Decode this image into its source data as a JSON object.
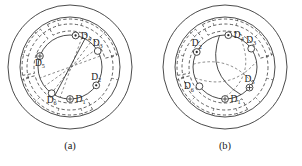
{
  "figure": {
    "background_color": "#ffffff",
    "line_color": "#2b2b2b",
    "panels": [
      {
        "id": "panel-a",
        "caption": "(a)",
        "center": {
          "x": 70,
          "y": 67
        },
        "radii": {
          "outer_solid": 62,
          "inner_solid": 50,
          "dashed_ring": 43,
          "bore": 32
        },
        "winding_style": "straight-diagonal",
        "coils": [
          {
            "name": "D",
            "subscript": "1",
            "symbol": "cross-circle",
            "angle_deg": 90,
            "label_side": "right"
          },
          {
            "name": "D",
            "subscript": "2",
            "symbol": "dot-circle",
            "angle_deg": 35,
            "label_side": "above"
          },
          {
            "name": "D",
            "subscript": "3",
            "symbol": "open-circle",
            "angle_deg": -30,
            "label_side": "above"
          },
          {
            "name": "D",
            "subscript": "4",
            "symbol": "dot-circle",
            "angle_deg": -80,
            "label_side": "right"
          },
          {
            "name": "D",
            "subscript": "5",
            "symbol": "cross-circle",
            "angle_deg": 200,
            "label_side": "below"
          },
          {
            "name": "D",
            "subscript": "6",
            "symbol": "open-circle",
            "angle_deg": 125,
            "label_side": "below"
          }
        ]
      },
      {
        "id": "panel-b",
        "caption": "(b)",
        "center": {
          "x": 225,
          "y": 67
        },
        "radii": {
          "outer_solid": 62,
          "inner_solid": 50,
          "dashed_ring": 43,
          "bore": 32
        },
        "winding_style": "skewed-curved",
        "coils": [
          {
            "name": "D",
            "subscript": "1",
            "symbol": "cross-circle",
            "angle_deg": 90,
            "label_side": "right"
          },
          {
            "name": "D",
            "subscript": "2",
            "symbol": "dot-circle",
            "angle_deg": 208,
            "label_side": "above"
          },
          {
            "name": "D",
            "subscript": "3",
            "symbol": "open-circle",
            "angle_deg": -35,
            "label_side": "above"
          },
          {
            "name": "D",
            "subscript": "4",
            "symbol": "dot-circle",
            "angle_deg": -84,
            "label_side": "right"
          },
          {
            "name": "D",
            "subscript": "5",
            "symbol": "cross-circle",
            "angle_deg": 40,
            "label_side": "above"
          },
          {
            "name": "D",
            "subscript": "6",
            "symbol": "open-circle",
            "angle_deg": 143,
            "label_side": "left"
          }
        ]
      }
    ]
  }
}
